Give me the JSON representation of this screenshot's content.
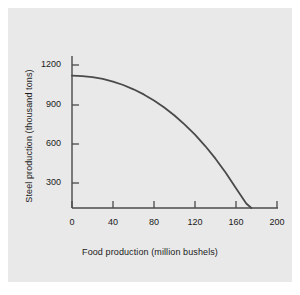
{
  "figure": {
    "background_color": "#e9e9e9",
    "page_color": "#ffffff",
    "axis_color": "#4a4a4a",
    "curve_color": "#4a4a4a",
    "text_color": "#1a1a1a"
  },
  "chart_data": {
    "type": "line",
    "title": "",
    "subtitle": "",
    "xlabel": "Food production (million bushels)",
    "ylabel": "Steel production (thousand tons)",
    "xlim": [
      0,
      200
    ],
    "ylim": [
      0,
      1300
    ],
    "xticks": [
      0,
      40,
      80,
      120,
      160,
      200
    ],
    "yticks": [
      300,
      600,
      900,
      1200
    ],
    "xtick_labels": [
      "0",
      "40",
      "80",
      "120",
      "160",
      "200"
    ],
    "ytick_labels": [
      "300",
      "600",
      "900",
      "1200"
    ],
    "grid": false,
    "legend": null,
    "annotations": [],
    "series": [
      {
        "name": "Production possibilities frontier",
        "x": [
          0,
          10,
          20,
          30,
          40,
          50,
          60,
          70,
          80,
          90,
          100,
          110,
          120,
          130,
          140,
          150,
          160,
          170,
          175
        ],
        "y": [
          1110,
          1107,
          1098,
          1083,
          1061,
          1032,
          996,
          953,
          902,
          843,
          776,
          700,
          615,
          520,
          414,
          296,
          165,
          38,
          0
        ]
      }
    ]
  }
}
